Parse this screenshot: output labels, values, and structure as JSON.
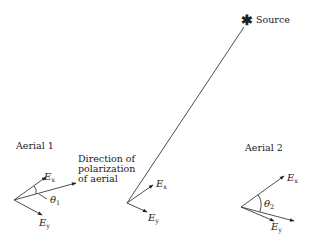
{
  "diagram": {
    "source": {
      "label": "Source",
      "icon": "asterisk-star-icon",
      "glyph": "✱"
    },
    "aerial1": {
      "label": "Aerial 1",
      "ex_label": "E",
      "ex_sub": "x",
      "ey_label": "E",
      "ey_sub": "y",
      "theta_label": "θ",
      "theta_sub": "1"
    },
    "polarization_note": {
      "line1": "Direction of",
      "line2": "polarization",
      "line3": "of aerial"
    },
    "center": {
      "ex_label": "E",
      "ex_sub": "x",
      "ey_label": "E",
      "ey_sub": "y"
    },
    "aerial2": {
      "label": "Aerial 2",
      "ex_label": "E",
      "ex_sub": "x",
      "ey_label": "E",
      "ey_sub": "y",
      "theta_label": "θ",
      "theta_sub": "2"
    },
    "colors": {
      "ink": "#222222",
      "background": "#ffffff"
    }
  }
}
